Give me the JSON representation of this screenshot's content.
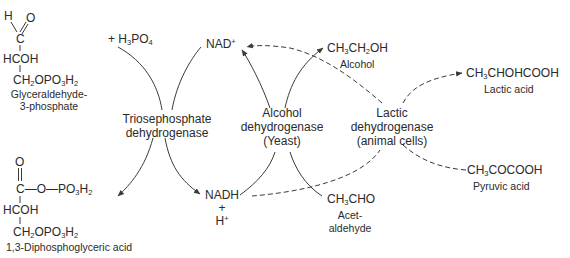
{
  "diagram": {
    "type": "biochemical-pathway",
    "nodes": {
      "glyceraldehyde": {
        "h": "H",
        "o": "O",
        "c": "C",
        "hcoh": "HCOH",
        "ch2": "CH",
        "ch2_sub": "2",
        "opo": "OPO",
        "opo_sub": "3",
        "h2": "H",
        "h2_sub": "2",
        "name_line1": "Glyceraldehyde-",
        "name_line2": "3-phosphate"
      },
      "h3po4": {
        "plus": "+ H",
        "sub3": "3",
        "po": "PO",
        "sub4": "4"
      },
      "diphospho": {
        "o": "O",
        "c": "C",
        "bond": "—O—PO",
        "sub3": "3",
        "h": "H",
        "sub2": "2",
        "hcoh": "HCOH",
        "ch2": "CH",
        "ch2_sub": "2",
        "opo": "OPO",
        "opo_sub": "3",
        "h2": "H",
        "h2_sub": "2",
        "name": "1,3-Diphosphoglyceric acid"
      },
      "triose_enzyme": {
        "line1": "Triosephosphate",
        "line2": "dehydrogenase"
      },
      "nad": {
        "label": "NAD",
        "sup": "+"
      },
      "nadh": {
        "line1": "NADH",
        "line2": "+",
        "line3": "H",
        "sup": "+"
      },
      "alcohol_enzyme": {
        "line1": "Alcohol",
        "line2": "dehydrogenase",
        "line3": "(Yeast)"
      },
      "ethanol": {
        "formula_a": "CH",
        "sub_a": "3",
        "formula_b": "CH",
        "sub_b": "2",
        "formula_c": "OH",
        "name": "Alcohol"
      },
      "acetaldehyde": {
        "formula_a": "CH",
        "sub_a": "3",
        "formula_b": "CHO",
        "name_line1": "Acet-",
        "name_line2": "aldehyde"
      },
      "lactic_enzyme": {
        "line1": "Lactic",
        "line2": "dehydrogenase",
        "line3": "(animal cells)"
      },
      "lactic_acid": {
        "formula_a": "CH",
        "sub_a": "3",
        "formula_b": "CHOHCOOH",
        "name": "Lactic acid"
      },
      "pyruvic_acid": {
        "formula_a": "CH",
        "sub_a": "3",
        "formula_b": "COCOOH",
        "name": "Pyruvic acid"
      }
    },
    "edges": [
      {
        "from": "H3PO4",
        "to": "Triosephosphate dehydrogenase",
        "style": "solid"
      },
      {
        "from": "Triosephosphate dehydrogenase",
        "to": "NAD+",
        "style": "solid"
      },
      {
        "from": "Triosephosphate dehydrogenase",
        "to": "1,3-Diphosphoglyceric acid",
        "style": "solid-arrow"
      },
      {
        "from": "Triosephosphate dehydrogenase",
        "to": "NADH + H+",
        "style": "solid-arrow"
      },
      {
        "from": "Alcohol dehydrogenase",
        "to": "NAD+",
        "style": "solid-arrow"
      },
      {
        "from": "Alcohol dehydrogenase",
        "to": "CH3CH2OH",
        "style": "solid-arrow"
      },
      {
        "from": "NADH",
        "to": "Alcohol dehydrogenase",
        "style": "solid"
      },
      {
        "from": "CH3CHO",
        "to": "Alcohol dehydrogenase",
        "style": "solid"
      },
      {
        "from": "Lactic dehydrogenase",
        "to": "NAD+",
        "style": "dashed-arrow"
      },
      {
        "from": "Lactic dehydrogenase",
        "to": "CH3CHOHCOOH",
        "style": "dashed-arrow"
      },
      {
        "from": "NADH",
        "to": "Lactic dehydrogenase",
        "style": "dashed"
      },
      {
        "from": "CH3COCOOH",
        "to": "Lactic dehydrogenase",
        "style": "dashed"
      }
    ],
    "colors": {
      "ink": "#2a2a2a",
      "line": "#3a3a3a",
      "background": "#ffffff"
    }
  }
}
